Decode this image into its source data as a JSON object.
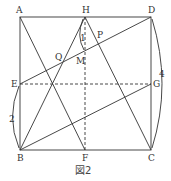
{
  "figure": {
    "caption": "図2",
    "points": {
      "A": {
        "label": "A",
        "x": 20,
        "y": 17
      },
      "H": {
        "label": "H",
        "x": 85,
        "y": 17
      },
      "D": {
        "label": "D",
        "x": 151,
        "y": 17
      },
      "E": {
        "label": "E",
        "x": 20,
        "y": 84
      },
      "G": {
        "label": "G",
        "x": 151,
        "y": 84
      },
      "B": {
        "label": "B",
        "x": 20,
        "y": 150
      },
      "F": {
        "label": "F",
        "x": 85,
        "y": 150
      },
      "C": {
        "label": "C",
        "x": 151,
        "y": 150
      },
      "Q": {
        "label": "Q"
      },
      "P": {
        "label": "P"
      },
      "M": {
        "label": "M"
      }
    },
    "measures": {
      "HM": "1",
      "EB": "2",
      "DC": "4"
    },
    "colors": {
      "stroke": "#333333"
    }
  }
}
